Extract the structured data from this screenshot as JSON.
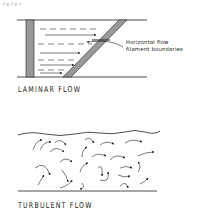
{
  "top_fragment": "rerer",
  "laminar": {
    "title": "LAMINAR FLOW",
    "annotation_line1": "Horizontal  flow",
    "annotation_line2": "filament  boundaries"
  },
  "turbulent": {
    "title": "TURBULENT   FLOW"
  },
  "colors": {
    "ink": "#222222",
    "hatch": "#888888"
  }
}
